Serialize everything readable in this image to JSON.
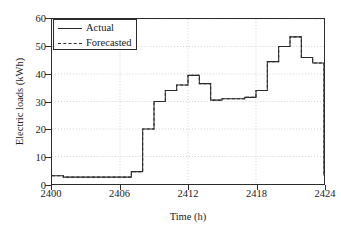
{
  "chart_data": {
    "type": "line",
    "title": "",
    "xlabel": "Time (h)",
    "ylabel": "Electric loads (kWh)",
    "xlim": [
      2400,
      2424
    ],
    "ylim": [
      0,
      60
    ],
    "xticks": [
      2400,
      2406,
      2412,
      2418,
      2424
    ],
    "yticks": [
      0,
      10,
      20,
      30,
      40,
      50,
      60
    ],
    "grid": true,
    "legend_position": "upper left",
    "drawstyle": "steps-post",
    "x": [
      2400,
      2401,
      2402,
      2403,
      2404,
      2405,
      2406,
      2407,
      2408,
      2409,
      2410,
      2411,
      2412,
      2413,
      2414,
      2415,
      2416,
      2417,
      2418,
      2419,
      2420,
      2421,
      2422,
      2423,
      2424
    ],
    "series": [
      {
        "name": "Actual",
        "style": "solid",
        "color": "#2b2b2b",
        "values": [
          3.0,
          2.5,
          2.5,
          2.5,
          2.5,
          2.5,
          2.5,
          4.5,
          20.0,
          30.0,
          34.0,
          36.0,
          39.5,
          36.5,
          30.5,
          31.0,
          31.0,
          31.5,
          34.0,
          44.5,
          50.0,
          53.5,
          46.0,
          44.0,
          15.0
        ]
      },
      {
        "name": "Forecasted",
        "style": "dashed",
        "color": "#2b2b2b",
        "values": [
          3.0,
          2.5,
          2.5,
          2.5,
          2.5,
          2.5,
          2.5,
          4.5,
          20.0,
          30.0,
          34.0,
          36.0,
          39.5,
          36.5,
          30.5,
          31.0,
          31.0,
          31.5,
          34.0,
          44.5,
          50.0,
          53.5,
          46.0,
          44.0,
          15.0
        ]
      }
    ],
    "tail": {
      "x": 2424,
      "value": 3.0
    }
  },
  "legend": {
    "entries": [
      {
        "label": "Actual",
        "style": "solid"
      },
      {
        "label": "Forecasted",
        "style": "dashed"
      }
    ]
  },
  "axes": {
    "xlabel": "Time (h)",
    "ylabel": "Electric loads (kWh)",
    "xtick_labels": [
      "2400",
      "2406",
      "2412",
      "2418",
      "2424"
    ],
    "ytick_labels": [
      "0",
      "10",
      "20",
      "30",
      "40",
      "50",
      "60"
    ]
  },
  "colors": {
    "line": "#2b2b2b",
    "grid": "#bfbfbf",
    "frame": "#2b2b2b",
    "background": "#ffffff"
  }
}
